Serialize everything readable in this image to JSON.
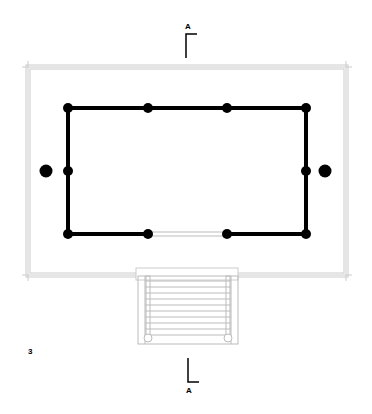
{
  "figure": {
    "number_label": "3",
    "section_marker_top": "A",
    "section_marker_bottom": "A"
  },
  "plan": {
    "platform": {
      "x": 28,
      "y": 66,
      "w": 318,
      "h": 208,
      "stroke": "#cfcfcf"
    },
    "column_frame": {
      "x": 68,
      "y": 108,
      "w": 238,
      "h": 126,
      "stroke": "#000000"
    },
    "columns_top": [
      68,
      148,
      227,
      306
    ],
    "columns_bottom": [
      68,
      148,
      227,
      306
    ],
    "columns_mid_y": 171,
    "outer_posts": [
      {
        "x": 46,
        "y": 171
      },
      {
        "x": 325,
        "y": 171
      }
    ],
    "opening": {
      "x1": 148,
      "x2": 227,
      "y": 234
    },
    "stair": {
      "x": 138,
      "y": 274,
      "w": 100,
      "h": 70,
      "treads": 12
    }
  }
}
